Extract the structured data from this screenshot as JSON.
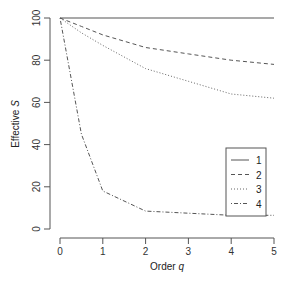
{
  "chart_data": {
    "type": "line",
    "title": "",
    "xlabel": "Order q",
    "xlabel_main": "Order ",
    "xlabel_italic": "q",
    "ylabel": "Effective S",
    "ylabel_main": "Effective ",
    "ylabel_italic": "S",
    "xlim": [
      0,
      5
    ],
    "ylim": [
      0,
      100
    ],
    "x_ticks": [
      "0",
      "1",
      "2",
      "3",
      "4",
      "5"
    ],
    "y_ticks": [
      "0",
      "20",
      "40",
      "60",
      "80",
      "100"
    ],
    "grid": false,
    "legend_position": "lower-right",
    "x": [
      0,
      0.5,
      1,
      2,
      3,
      4,
      5
    ],
    "series": [
      {
        "name": "1",
        "line_style": "solid",
        "values": [
          100,
          100,
          100,
          100,
          100,
          100,
          100
        ]
      },
      {
        "name": "2",
        "line_style": "dashed",
        "values": [
          100,
          96,
          92,
          86,
          83,
          80,
          78
        ]
      },
      {
        "name": "3",
        "line_style": "dotted",
        "values": [
          100,
          93,
          87,
          76,
          70,
          64,
          62
        ]
      },
      {
        "name": "4",
        "line_style": "dotdash",
        "values": [
          100,
          45,
          18,
          8.5,
          7.5,
          6.5,
          6.5
        ]
      }
    ]
  }
}
